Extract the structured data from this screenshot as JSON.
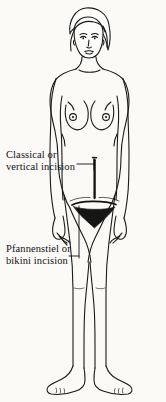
{
  "diagram": {
    "type": "medical-illustration",
    "background_color": "#fbfaf7",
    "line_color": "#1a1a1a",
    "annotations": [
      {
        "name": "classical-vertical-incision",
        "lines": [
          "Classical or",
          "vertical incision"
        ],
        "line_1": "Classical or",
        "line_2": "vertical incision",
        "leader": "horizontal line with vertical tick to abdominal midline",
        "marker": "vertical dark line from navel to pubis"
      },
      {
        "name": "pfannenstiel-bikini-incision",
        "lines": [
          "Pfannenstiel or",
          "bikini incision"
        ],
        "line_1": "Pfannenstiel or",
        "line_2": "bikini incision",
        "leader": "horizontal line with vertical tick to low transverse line",
        "marker": "curved horizontal line above pubic area"
      }
    ]
  }
}
